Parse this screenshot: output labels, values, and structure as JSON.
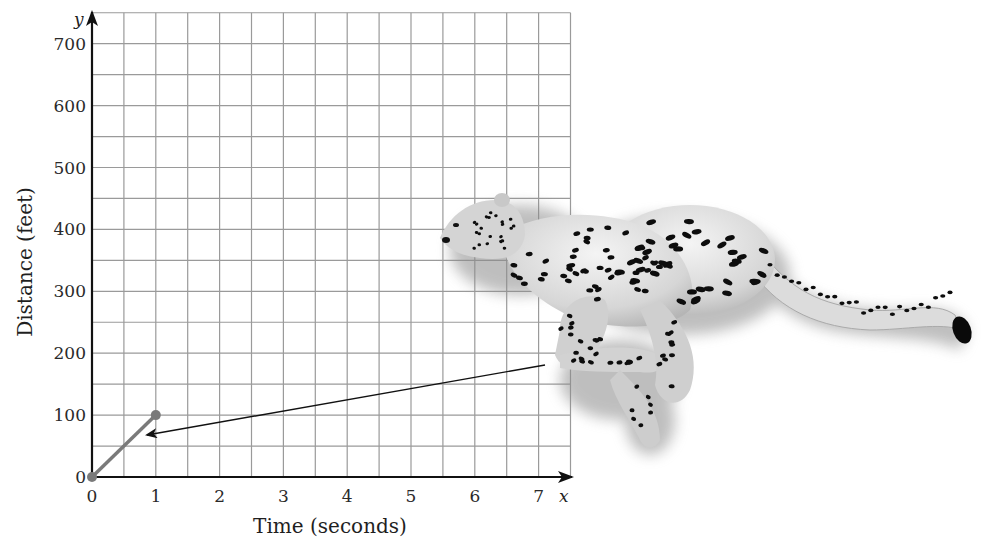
{
  "chart_data": {
    "type": "line",
    "title": "",
    "xlabel": "Time (seconds)",
    "ylabel": "Distance (feet)",
    "x_axis_var": "x",
    "y_axis_var": "y",
    "xlim": [
      0,
      7.5
    ],
    "ylim": [
      0,
      750
    ],
    "x_ticks": [
      0,
      1,
      2,
      3,
      4,
      5,
      6,
      7
    ],
    "y_ticks": [
      0,
      100,
      200,
      300,
      400,
      500,
      600,
      700
    ],
    "x_tick_labels": [
      "0",
      "1",
      "2",
      "3",
      "4",
      "5",
      "6",
      "7"
    ],
    "y_tick_labels": [
      "0",
      "100",
      "200",
      "300",
      "400",
      "500",
      "600",
      "700"
    ],
    "grid": true,
    "grid_x_step": 0.5,
    "grid_y_step": 50,
    "legend": null,
    "series": [
      {
        "name": "cheetah",
        "x": [
          0,
          1
        ],
        "y": [
          0,
          100
        ],
        "color": "#7a7a7a",
        "markers": true
      }
    ],
    "annotations": [
      {
        "type": "arrow",
        "from": "cheetah illustration (front paw)",
        "to_data_point": [
          0.85,
          70
        ],
        "description": "Arrow from running cheetah illustration pointing to the line segment"
      },
      {
        "type": "illustration",
        "description": "Spotted cheetah running leftward, overlapping right side of grid"
      }
    ]
  },
  "colors": {
    "grid": "#9a9a9a",
    "axis": "#111111",
    "series": "#7a7a7a",
    "cheetah_body": "#d9d9d9",
    "cheetah_spots": "#111111"
  }
}
